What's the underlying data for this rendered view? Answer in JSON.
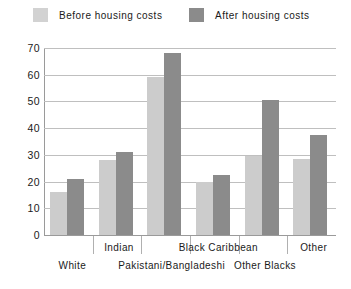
{
  "legend": {
    "entries": [
      {
        "label": "Before housing costs",
        "color": "#cccccc",
        "key": "before"
      },
      {
        "label": "After housing costs",
        "color": "#8b8b8b",
        "key": "after"
      }
    ]
  },
  "axes": {
    "y_ticks": [
      "70",
      "60",
      "50",
      "40",
      "30",
      "20",
      "10",
      "0"
    ],
    "ymin": 0,
    "ymax": 70
  },
  "chart_data": {
    "type": "bar",
    "title": "",
    "xlabel": "",
    "ylabel": "",
    "ylim": [
      0,
      70
    ],
    "ytick_step": 10,
    "grid": true,
    "legend_position": "top",
    "categories": [
      "White",
      "Indian",
      "Pakistani/Bangladeshi",
      "Black Caribbean",
      "Other Blacks",
      "Other"
    ],
    "series": [
      {
        "name": "Before housing costs",
        "color": "#cccccc",
        "values": [
          16,
          28,
          59,
          20,
          29.5,
          28.5
        ]
      },
      {
        "name": "After housing costs",
        "color": "#8b8b8b",
        "values": [
          21,
          31,
          68,
          22.5,
          50.5,
          37.5
        ]
      }
    ]
  }
}
